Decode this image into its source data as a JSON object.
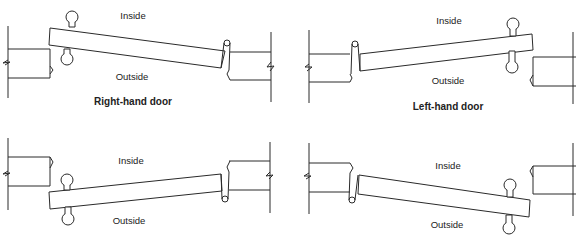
{
  "panels": [
    {
      "id": "right-hand-top",
      "inside": "Inside",
      "outside": "Outside",
      "caption": "Right-hand door"
    },
    {
      "id": "left-hand-top",
      "inside": "Inside",
      "outside": "Outside",
      "caption": "Left-hand door"
    },
    {
      "id": "right-hand-bottom",
      "inside": "Inside",
      "outside": "Outside",
      "caption": ""
    },
    {
      "id": "left-hand-bottom",
      "inside": "Inside",
      "outside": "Outside",
      "caption": ""
    }
  ],
  "colors": {
    "line": "#2a2a2a",
    "background": "#ffffff"
  }
}
